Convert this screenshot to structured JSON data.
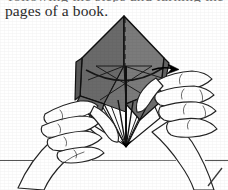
{
  "page": {
    "width": 228,
    "height": 190,
    "background_color": "#ffffff",
    "media": "scanned-book-page"
  },
  "text": {
    "clipped_top_line": "following the steps and turning the",
    "caption": "pages of a book."
  },
  "illustration": {
    "title": "hands-holding-origami-model",
    "description": "Two hands hold a partly folded gray origami model above a table surface",
    "colors": {
      "paper_front": "#7b7b7b",
      "paper_shadow": "#5f5f5f",
      "paper_highlight": "#8e8e8e",
      "paper_white": "#ffffff",
      "outline": "#1a1a1a",
      "crease": "#2a2a2a",
      "skin_outline": "#222222",
      "table_line": "#555555",
      "arrow": "#000000"
    },
    "parts": [
      {
        "name": "origami-model",
        "label": "folded paper model"
      },
      {
        "name": "left-hand",
        "label": "left hand"
      },
      {
        "name": "right-hand",
        "label": "right hand"
      },
      {
        "name": "fold-arrow",
        "label": "fold direction arrow"
      },
      {
        "name": "center-fold-line",
        "label": "dashed center valley fold"
      },
      {
        "name": "table-surface-line",
        "label": "table edge line"
      },
      {
        "name": "page-corner-mark",
        "label": "page corner mark"
      }
    ]
  }
}
